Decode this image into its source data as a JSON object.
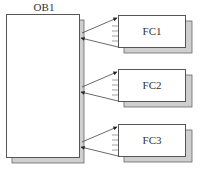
{
  "diagram": {
    "main_block": {
      "label": "OB1"
    },
    "blocks": [
      {
        "label": "FC1"
      },
      {
        "label": "FC2"
      },
      {
        "label": "FC3"
      }
    ],
    "colors": {
      "stroke": "#555555",
      "fill": "#ffffff",
      "shadow": "#cfcfcf",
      "arrow": "#444444",
      "text": "#333333"
    }
  }
}
